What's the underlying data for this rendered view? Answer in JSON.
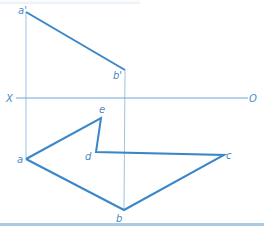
{
  "colors": {
    "thick_line": "#3a86c8",
    "thin_line": "#9cc4e4",
    "label": "#4a8ac8",
    "bottom_rule": "#a9cbe6"
  },
  "axis": {
    "left_label": "X",
    "right_label": "O",
    "y": 98,
    "x1": 16,
    "x2": 248
  },
  "points": {
    "a_prime": {
      "label": "a'",
      "x": 26,
      "y": 12
    },
    "b_prime": {
      "label": "b'",
      "x": 125,
      "y": 70
    },
    "a": {
      "label": "a",
      "x": 26,
      "y": 159
    },
    "b": {
      "label": "b",
      "x": 124,
      "y": 210
    },
    "c": {
      "label": "c",
      "x": 224,
      "y": 155
    },
    "d": {
      "label": "d",
      "x": 96,
      "y": 152
    },
    "e": {
      "label": "e",
      "x": 101,
      "y": 118
    }
  }
}
